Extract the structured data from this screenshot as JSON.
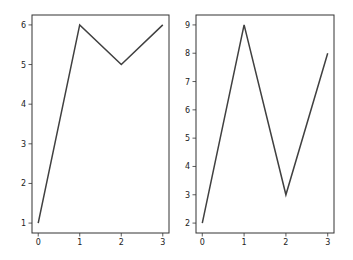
{
  "chart_data": [
    {
      "type": "line",
      "title": "",
      "xlabel": "",
      "ylabel": "",
      "x": [
        0,
        1,
        2,
        3
      ],
      "values": [
        1,
        6,
        5,
        6
      ],
      "xticks": [
        "0",
        "1",
        "2",
        "3"
      ],
      "yticks": [
        "1",
        "2",
        "3",
        "4",
        "5",
        "6"
      ],
      "xlim": [
        -0.15,
        3.15
      ],
      "ylim": [
        0.75,
        6.25
      ],
      "grid": false,
      "line_color": "#404040"
    },
    {
      "type": "line",
      "title": "",
      "xlabel": "",
      "ylabel": "",
      "x": [
        0,
        1,
        2,
        3
      ],
      "values": [
        2,
        9,
        3,
        8
      ],
      "xticks": [
        "0",
        "1",
        "2",
        "3"
      ],
      "yticks": [
        "2",
        "3",
        "4",
        "5",
        "6",
        "7",
        "8",
        "9"
      ],
      "xlim": [
        -0.15,
        3.15
      ],
      "ylim": [
        1.65,
        9.35
      ],
      "grid": false,
      "line_color": "#404040"
    }
  ]
}
